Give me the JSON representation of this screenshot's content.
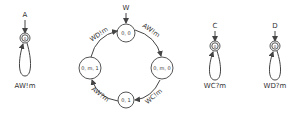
{
  "diagram": {
    "type": "state-machine",
    "colors": {
      "stroke": "#444444",
      "text": "#333333",
      "background": "#ffffff"
    },
    "machines": [
      {
        "id": "A",
        "entry_label": "A",
        "state_label": "0",
        "loop_label": "AW!m"
      },
      {
        "id": "W",
        "entry_label": "W",
        "states": [
          {
            "id": "s00",
            "label": "0, 0"
          },
          {
            "id": "s0m0",
            "label": "0, m, 0"
          },
          {
            "id": "s01",
            "label": "0, 1"
          },
          {
            "id": "s0m1",
            "label": "0, m, 1"
          }
        ],
        "edges": [
          {
            "from": "s00",
            "to": "s0m0",
            "label": "AW!m"
          },
          {
            "from": "s0m0",
            "to": "s01",
            "label": "WC!m"
          },
          {
            "from": "s01",
            "to": "s0m1",
            "label": "AW?m"
          },
          {
            "from": "s0m1",
            "to": "s00",
            "label": "WD!m"
          }
        ]
      },
      {
        "id": "C",
        "entry_label": "C",
        "state_label": "0",
        "loop_label": "WC?m"
      },
      {
        "id": "D",
        "entry_label": "D",
        "state_label": "0",
        "loop_label": "WD?m"
      }
    ]
  }
}
